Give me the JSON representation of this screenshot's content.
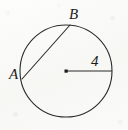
{
  "figure": {
    "type": "geometry-diagram",
    "background_color": "#fbfbf9",
    "stroke_color": "#2b2b2b",
    "label_color": "#1c1c1c"
  },
  "circle": {
    "center_x": 66,
    "center_y": 71,
    "radius": 46,
    "stroke_width": 1.1
  },
  "center_dot": {
    "x": 66,
    "y": 71,
    "size": 3
  },
  "chord": {
    "from_point": "A",
    "to_point": "B",
    "x1": 22,
    "y1": 79,
    "x2": 70,
    "y2": 25,
    "stroke_width": 1.1
  },
  "radius_segment": {
    "x1": 66,
    "y1": 71,
    "x2": 112,
    "y2": 71,
    "stroke_width": 1.1,
    "measure_label": "4"
  },
  "labels": {
    "point_b": "B",
    "point_a": "A",
    "radius_value": "4"
  }
}
